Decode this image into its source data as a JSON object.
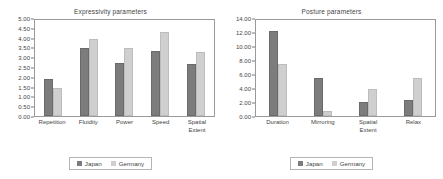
{
  "chart_data": [
    {
      "type": "bar",
      "title": "Expressivity parameters",
      "xlabel": "",
      "ylabel": "",
      "ylim": [
        0,
        5
      ],
      "ytick_step": 0.5,
      "grid": false,
      "legend_position": "bottom",
      "ytick_labels": [
        "5.00",
        "4.50",
        "4.00",
        "3.50",
        "3.00",
        "2.50",
        "2.00",
        "1.50",
        "1.00",
        "0.50",
        "0.00"
      ],
      "categories": [
        "Repetition",
        "Fluidity",
        "Power",
        "Speed",
        "Spatial\nExtent"
      ],
      "series": [
        {
          "name": "Japan",
          "color": "#7c7c7c",
          "values": [
            1.9,
            3.48,
            2.72,
            3.3,
            2.67
          ]
        },
        {
          "name": "Germany",
          "color": "#cfcfcf",
          "values": [
            1.42,
            3.93,
            3.47,
            4.3,
            3.28
          ]
        }
      ]
    },
    {
      "type": "bar",
      "title": "Posture parameters",
      "xlabel": "",
      "ylabel": "",
      "ylim": [
        0,
        14
      ],
      "ytick_step": 2.0,
      "grid": false,
      "legend_position": "bottom",
      "ytick_labels": [
        "14.00",
        "12.00",
        "10.00",
        "8.00",
        "6.00",
        "4.00",
        "2.00",
        "0.00"
      ],
      "categories": [
        "Duration",
        "Mirroring",
        "Spatial\nExtent",
        "Relax"
      ],
      "series": [
        {
          "name": "Japan",
          "color": "#7c7c7c",
          "values": [
            12.2,
            5.45,
            1.95,
            2.25
          ]
        },
        {
          "name": "Germany",
          "color": "#cfcfcf",
          "values": [
            7.5,
            0.75,
            3.9,
            5.45
          ]
        }
      ]
    }
  ]
}
